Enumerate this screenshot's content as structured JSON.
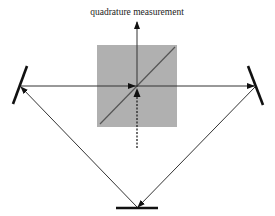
{
  "title": "quadrature measurement",
  "colors": {
    "line": "#333333",
    "mirror": "#111111",
    "beamsplitter_fill": "#b0b0b0",
    "beamsplitter_diagonal": "#555555",
    "background": "#ffffff"
  },
  "elements": {
    "beamsplitter": {
      "x": 97,
      "y": 45,
      "width": 80,
      "height": 82
    },
    "left_mirror": {
      "x1": 27,
      "y1": 66,
      "x2": 13,
      "y2": 104
    },
    "right_mirror": {
      "x1": 248,
      "y1": 66,
      "x2": 263,
      "y2": 105
    },
    "bottom_mirror": {
      "x1": 116,
      "y1": 208,
      "x2": 158,
      "y2": 208
    }
  }
}
